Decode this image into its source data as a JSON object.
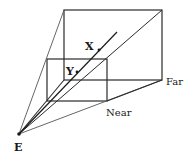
{
  "diagram": {
    "labels": {
      "eye": "E",
      "point_x": "X",
      "point_y": "Y",
      "near": "Near",
      "far": "Far"
    },
    "colors": {
      "line": "#2a2a2a",
      "thin_line": "#555555",
      "background": "#ffffff"
    }
  }
}
